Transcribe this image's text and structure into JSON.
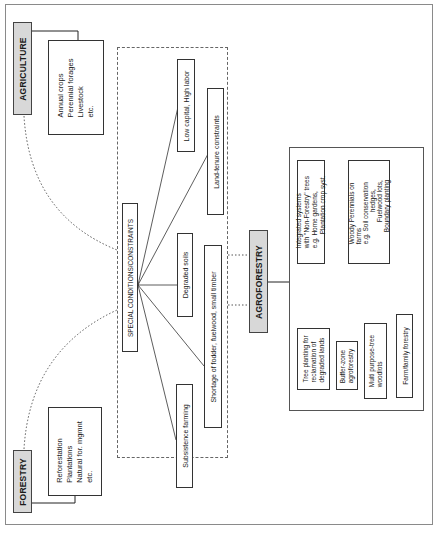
{
  "diagram": {
    "orientation": "rotated 90 degrees counter-clockwise",
    "agriculture": {
      "title": "AGRICULTURE",
      "items": [
        "Annual crops",
        "Perennial forages",
        "Livestock",
        "etc."
      ]
    },
    "forestry": {
      "title": "FORESTRY",
      "items": [
        "Reforestation",
        "Plantations",
        "Natural for. mgmnt",
        "etc."
      ]
    },
    "special_conditions": {
      "title": "SPECIAL CONDITIONS/CONSTRAINTS",
      "items": [
        "Low capital, High labor",
        "Land-tenure constraints",
        "Degraded soils",
        "Shortage of fodder, fuelwood, small timber",
        "Subsistence farming"
      ]
    },
    "agroforestry": {
      "title": "AGROFORESTRY",
      "systems": [
        {
          "lines": [
            "Integrated systems",
            "with \"Non-Forestry\" trees",
            "e.g. Home gardens,",
            "Plantation crop syst."
          ]
        },
        {
          "lines": [
            "Woody Perennials on",
            "farms",
            "e.g. Soil conservation",
            "hedges,",
            "Fuelwood lots,",
            "Boundary planting"
          ]
        },
        {
          "lines": [
            "Tree planting for",
            "reclamation of",
            "degraded lands"
          ]
        },
        {
          "lines": [
            "Buffer-zone",
            "agroforestry"
          ]
        },
        {
          "lines": [
            "Multi purpose-tree",
            "woodlots"
          ]
        },
        {
          "lines": [
            "Farm/family forestry"
          ]
        }
      ]
    }
  }
}
